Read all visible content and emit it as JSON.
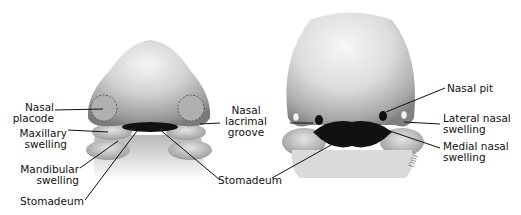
{
  "left_figure": {
    "labels": {
      "nasal_placode": [
        "Nasal",
        "placode"
      ],
      "maxillary_swelling": [
        "Maxillary",
        "swelling"
      ],
      "mandibular_swelling": [
        "Mandibular",
        "swelling"
      ],
      "stomadeum": "Stomadeum"
    }
  },
  "middle_labels": {
    "nasal_lacrimal_groove": [
      "Nasal",
      "lacrimal",
      "groove"
    ],
    "stomadeum": "Stomadeum"
  },
  "right_figure": {
    "labels": {
      "nasal_pit": "Nasal pit",
      "lateral_nasal_swelling": [
        "Lateral nasal",
        "swelling"
      ],
      "medial_nasal_swelling": [
        "Medial nasal",
        "swelling"
      ]
    },
    "signature": "DBP"
  },
  "colors": {
    "skin_light": "#ededed",
    "skin_mid": "#bdbdbd",
    "skin_dark": "#7a7a7a",
    "cavity": "#111111",
    "line": "#111111"
  }
}
